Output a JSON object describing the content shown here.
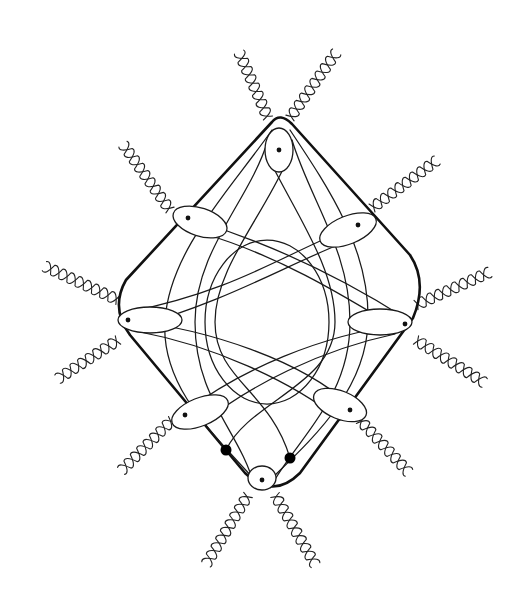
{
  "figure": {
    "stroke_color": "#111111",
    "background": "#ffffff",
    "frame_path": "M272,122 Q280,112 292,124 L410,255 Q428,282 413,318 L300,473 Q273,500 245,473 L130,335 Q110,308 126,280 Z",
    "loops": [
      {
        "name": "top",
        "cx": 279,
        "cy": 150,
        "rx": 14,
        "ry": 22,
        "rot": 0,
        "dot": [
          279,
          150
        ]
      },
      {
        "name": "upper-left",
        "cx": 200,
        "cy": 222,
        "rx": 28,
        "ry": 14,
        "rot": 18,
        "dot": [
          188,
          218
        ]
      },
      {
        "name": "upper-right",
        "cx": 348,
        "cy": 230,
        "rx": 30,
        "ry": 14,
        "rot": -22,
        "dot": [
          358,
          225
        ]
      },
      {
        "name": "left",
        "cx": 150,
        "cy": 320,
        "rx": 32,
        "ry": 13,
        "rot": 0,
        "dot": [
          128,
          320
        ]
      },
      {
        "name": "right",
        "cx": 380,
        "cy": 322,
        "rx": 32,
        "ry": 13,
        "rot": 0,
        "dot": [
          405,
          324
        ]
      },
      {
        "name": "lower-left",
        "cx": 200,
        "cy": 412,
        "rx": 30,
        "ry": 14,
        "rot": -22,
        "dot": [
          185,
          415
        ]
      },
      {
        "name": "lower-right",
        "cx": 340,
        "cy": 405,
        "rx": 28,
        "ry": 14,
        "rot": 22,
        "dot": [
          350,
          410
        ]
      },
      {
        "name": "bottom",
        "cx": 262,
        "cy": 478,
        "rx": 14,
        "ry": 12,
        "rot": 0,
        "dot": [
          262,
          480
        ]
      }
    ],
    "terminal_dots": [
      [
        226,
        450
      ],
      [
        290,
        458
      ]
    ],
    "cords": [
      "M272,130 C230,190 170,250 165,320 C160,390 220,440 262,488",
      "M290,130 C330,190 370,250 368,322 C366,395 305,445 262,488",
      "M268,140 C250,200 195,250 195,322 C195,400 240,430 255,488",
      "M292,140 C310,200 350,250 350,322 C350,400 295,440 270,488",
      "M285,165 C260,220 215,270 215,322 C215,380 270,390 290,458",
      "M272,165 C300,220 335,270 335,322 C335,385 250,400 226,450",
      "M188,218 C260,240 330,270 405,318",
      "M205,234 C275,255 335,290 400,330",
      "M358,225 C290,250 240,290 128,312",
      "M345,242 C280,268 230,300 132,328",
      "M128,320 C210,330 300,360 350,405",
      "M405,324 C320,335 240,370 185,412",
      "M140,332 C210,345 290,380 340,420",
      "M395,334 C320,350 250,385 200,425"
    ],
    "inner_ring": {
      "cx": 267,
      "cy": 322,
      "rx": 62,
      "ry": 82
    },
    "braids": [
      {
        "name": "top-left",
        "from": [
          268,
          118
        ],
        "to": [
          236,
          45
        ]
      },
      {
        "name": "top-right",
        "from": [
          290,
          118
        ],
        "to": [
          338,
          50
        ]
      },
      {
        "name": "upper-left",
        "from": [
          170,
          210
        ],
        "to": [
          120,
          140
        ]
      },
      {
        "name": "upper-right",
        "from": [
          372,
          208
        ],
        "to": [
          440,
          158
        ]
      },
      {
        "name": "left-upper",
        "from": [
          118,
          300
        ],
        "to": [
          44,
          266
        ]
      },
      {
        "name": "left-lower",
        "from": [
          118,
          340
        ],
        "to": [
          50,
          384
        ]
      },
      {
        "name": "right-upper",
        "from": [
          416,
          305
        ],
        "to": [
          490,
          272
        ]
      },
      {
        "name": "right-lower",
        "from": [
          416,
          340
        ],
        "to": [
          488,
          385
        ]
      },
      {
        "name": "lower-left",
        "from": [
          172,
          420
        ],
        "to": [
          118,
          474
        ]
      },
      {
        "name": "lower-right",
        "from": [
          360,
          420
        ],
        "to": [
          412,
          476
        ]
      },
      {
        "name": "bottom-left",
        "from": [
          248,
          495
        ],
        "to": [
          205,
          566
        ]
      },
      {
        "name": "bottom-right",
        "from": [
          275,
          495
        ],
        "to": [
          316,
          566
        ]
      }
    ]
  }
}
